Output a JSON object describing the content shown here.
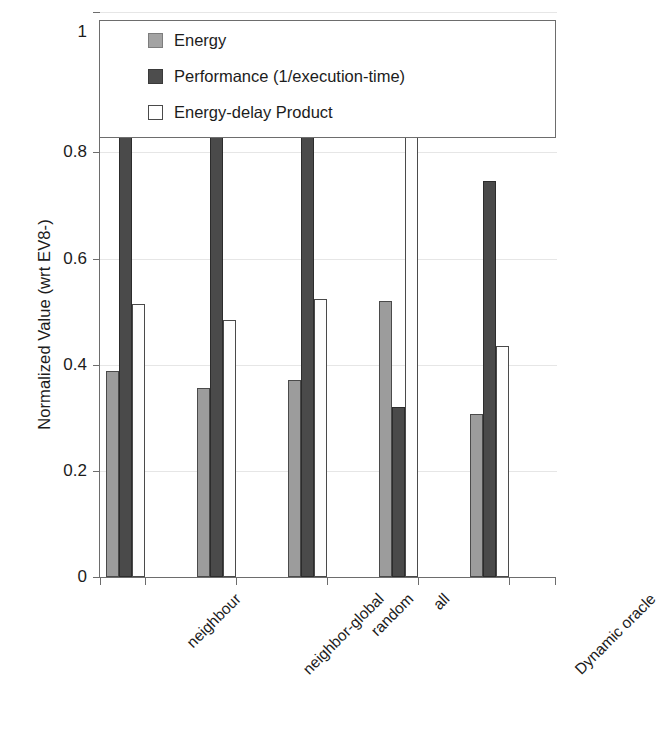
{
  "chart_data": {
    "type": "bar",
    "title": "",
    "xlabel": "",
    "ylabel": "Normalized Value (wrt EV8-)",
    "ylim": [
      0,
      1.05
    ],
    "yticks": [
      0,
      0.2,
      0.4,
      0.6,
      0.8,
      1
    ],
    "ytick_labels": [
      "0",
      "0.2",
      "0.4",
      "0.6",
      "0.8",
      "1"
    ],
    "grid": true,
    "legend_position": "top",
    "categories": [
      "neighbour",
      "neighbor-global",
      "random",
      "all",
      "Dynamic oracle"
    ],
    "series": [
      {
        "name": "Energy",
        "color": "#9c9c9c",
        "values": [
          0.31,
          0.285,
          0.297,
          0.415,
          0.245
        ]
      },
      {
        "name": "Performance (1/execution-time)",
        "color": "#4a4a4a",
        "values": [
          0.79,
          0.777,
          0.753,
          0.255,
          0.595
        ]
      },
      {
        "name": "Energy-delay Product",
        "color": "#ffffff",
        "values": [
          0.41,
          0.387,
          0.418,
          0.703,
          0.347
        ]
      }
    ]
  },
  "legend": {
    "items": [
      {
        "label": "Energy",
        "swatch": "energy"
      },
      {
        "label": "Performance (1/execution-time)",
        "swatch": "perf"
      },
      {
        "label": "Energy-delay Product",
        "swatch": "edp"
      }
    ]
  },
  "axes": {
    "y_title": "Normalized Value (wrt EV8-)",
    "y_tick_labels": [
      "1",
      "0.8",
      "0.6",
      "0.4",
      "0.2",
      "0"
    ],
    "x_tick_labels": [
      "neighbour",
      "neighbor-global",
      "random",
      "all",
      "Dynamic oracle"
    ]
  }
}
